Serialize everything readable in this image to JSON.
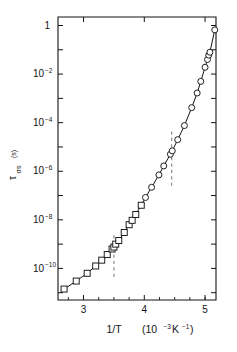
{
  "figure": {
    "background": "#ffffff",
    "ink": "#141414",
    "dash_color": "#8a8a8a",
    "plot_box": {
      "left": 58,
      "right": 216,
      "top": 17,
      "bottom": 300
    }
  },
  "chart_data": {
    "type": "line",
    "title": "",
    "subtitle": "",
    "xlabel": "1/T   (10⁻³ K⁻¹)",
    "xlabel_main": "1/T",
    "xlabel_units_prefix": "(10",
    "xlabel_units_exp": "-3",
    "xlabel_units_suffix": " K",
    "xlabel_units_exp2": "-1",
    "xlabel_units_close": ")",
    "ylabel": "τσs (s)",
    "ylabel_tau": "τ",
    "ylabel_sub": "σs",
    "ylabel_units": "(s)",
    "xlim": [
      2.58,
      5.18
    ],
    "ylim_log": [
      -11.3,
      0.35
    ],
    "yscale": "log",
    "xticks": [
      3,
      4,
      5
    ],
    "xticklabels": [
      "3",
      "4",
      "5"
    ],
    "xminorticks": [
      2.75,
      3.25,
      3.5,
      3.75,
      4.25,
      4.5,
      4.75,
      5.0
    ],
    "yticks_exponents": [
      0,
      -1,
      -2,
      -3,
      -4,
      -5,
      -6,
      -7,
      -8,
      -9,
      -10,
      -11
    ],
    "yticklabels": [
      {
        "exp": 0,
        "mantissa": "1",
        "show": true
      },
      {
        "exp": -2,
        "mantissa": "10",
        "show": true
      },
      {
        "exp": -4,
        "mantissa": "10",
        "show": true
      },
      {
        "exp": -6,
        "mantissa": "10",
        "show": true
      },
      {
        "exp": -8,
        "mantissa": "10",
        "show": true
      },
      {
        "exp": -10,
        "mantissa": "10",
        "show": true
      }
    ],
    "grid": false,
    "legend": "none",
    "annotations": [
      {
        "name": "phase-boundary-1",
        "type": "vertical-dashed-line",
        "x": 3.5,
        "y_log_from": -10.35,
        "y_log_to": -8.55
      },
      {
        "name": "phase-boundary-2",
        "type": "vertical-dashed-line",
        "x": 4.45,
        "y_log_from": -6.6,
        "y_log_to": -4.3
      }
    ],
    "series": [
      {
        "name": "low-temperature-branch",
        "marker": "square",
        "marker_size": 4.2,
        "points": [
          {
            "x": 2.68,
            "y_log": -10.85
          },
          {
            "x": 2.88,
            "y_log": -10.52
          },
          {
            "x": 3.06,
            "y_log": -10.2
          },
          {
            "x": 3.2,
            "y_log": -9.9
          },
          {
            "x": 3.3,
            "y_log": -9.66
          },
          {
            "x": 3.39,
            "y_log": -9.43
          },
          {
            "x": 3.47,
            "y_log": -9.2
          },
          {
            "x": 3.5,
            "y_log": -9.12
          },
          {
            "x": 3.53,
            "y_log": -9.0
          },
          {
            "x": 3.58,
            "y_log": -8.85
          },
          {
            "x": 3.67,
            "y_log": -8.52
          },
          {
            "x": 3.75,
            "y_log": -8.2
          },
          {
            "x": 3.8,
            "y_log": -8.02
          },
          {
            "x": 3.86,
            "y_log": -7.78
          },
          {
            "x": 3.95,
            "y_log": -7.4
          }
        ]
      },
      {
        "name": "high-temperature-branch",
        "marker": "circle",
        "marker_size": 4.2,
        "points": [
          {
            "x": 4.02,
            "y_log": -7.08
          },
          {
            "x": 4.12,
            "y_log": -6.66
          },
          {
            "x": 4.24,
            "y_log": -6.15
          },
          {
            "x": 4.32,
            "y_log": -5.78
          },
          {
            "x": 4.43,
            "y_log": -5.3
          },
          {
            "x": 4.46,
            "y_log": -5.16
          },
          {
            "x": 4.55,
            "y_log": -4.7
          },
          {
            "x": 4.66,
            "y_log": -4.12
          },
          {
            "x": 4.78,
            "y_log": -3.38
          },
          {
            "x": 4.87,
            "y_log": -2.78
          },
          {
            "x": 4.93,
            "y_log": -2.3
          },
          {
            "x": 5.0,
            "y_log": -1.72
          },
          {
            "x": 5.04,
            "y_log": -1.4
          },
          {
            "x": 5.06,
            "y_log": -1.22
          },
          {
            "x": 5.08,
            "y_log": -1.1
          },
          {
            "x": 5.16,
            "y_log": -0.18
          }
        ]
      }
    ]
  }
}
